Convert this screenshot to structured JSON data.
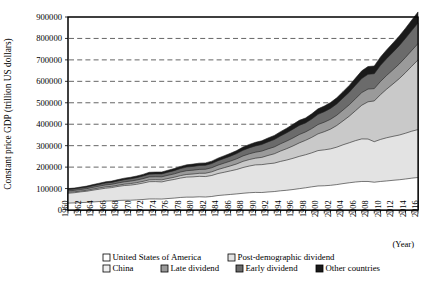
{
  "chart_data": {
    "type": "area",
    "stacked": true,
    "title": "",
    "xlabel": "(Year)",
    "ylabel": "Constant price GDP (trillion US dollars)",
    "ylim": [
      0,
      900000
    ],
    "ytick_step": 100000,
    "yticks": [
      0,
      100000,
      200000,
      300000,
      400000,
      500000,
      600000,
      700000,
      800000,
      900000
    ],
    "grid": true,
    "grid_axis": "y",
    "legend_position": "bottom",
    "x": [
      1960,
      1961,
      1962,
      1963,
      1964,
      1965,
      1966,
      1967,
      1968,
      1969,
      1970,
      1971,
      1972,
      1973,
      1974,
      1975,
      1976,
      1977,
      1978,
      1979,
      1980,
      1981,
      1982,
      1983,
      1984,
      1985,
      1986,
      1987,
      1988,
      1989,
      1990,
      1991,
      1992,
      1993,
      1994,
      1995,
      1996,
      1997,
      1998,
      1999,
      2000,
      2001,
      2002,
      2003,
      2004,
      2005,
      2006,
      2007,
      2008,
      2009,
      2010,
      2011,
      2012,
      2013,
      2014,
      2015,
      2016
    ],
    "xtick_labels": [
      "1960",
      "1962",
      "1964",
      "1966",
      "1968",
      "1970",
      "1972",
      "1974",
      "1976",
      "1978",
      "1980",
      "1982",
      "1984",
      "1986",
      "1988",
      "1990",
      "1992",
      "1994",
      "1996",
      "1998",
      "2000",
      "2002",
      "2004",
      "2006",
      "2008",
      "2010",
      "2012",
      "2014",
      "2016"
    ],
    "xlim": [
      1960,
      2016
    ],
    "series": [
      {
        "name": "United States of America",
        "fill": "#ffffff",
        "values": [
          32000,
          33000,
          34500,
          35500,
          37500,
          39500,
          41500,
          42500,
          44500,
          45500,
          45500,
          47000,
          49000,
          51500,
          51500,
          51000,
          53500,
          55500,
          58500,
          60000,
          60000,
          61500,
          60500,
          63000,
          67500,
          70000,
          72500,
          75000,
          78000,
          80500,
          82000,
          81500,
          84000,
          86000,
          89500,
          92000,
          95500,
          99500,
          103500,
          108000,
          112000,
          113000,
          115000,
          118500,
          123000,
          127000,
          130500,
          133000,
          133000,
          129500,
          133000,
          135500,
          138500,
          141000,
          144500,
          148500,
          151500
        ]
      },
      {
        "name": "Post-demographic dividend",
        "fill": "#e3e3e3",
        "values": [
          46000,
          47500,
          50000,
          52000,
          55000,
          57500,
          60000,
          62000,
          65500,
          68500,
          70500,
          73000,
          76500,
          80500,
          81000,
          80000,
          84000,
          87000,
          90500,
          93500,
          94500,
          95500,
          95500,
          98000,
          102500,
          106000,
          110000,
          114000,
          120000,
          124500,
          128500,
          130000,
          131500,
          132500,
          137000,
          141000,
          145500,
          150500,
          154000,
          158500,
          165000,
          167500,
          170000,
          174500,
          181000,
          186500,
          193000,
          198500,
          198000,
          189000,
          196000,
          201500,
          205000,
          208500,
          213500,
          219000,
          223500
        ]
      },
      {
        "name": "China",
        "fill": "#c9c9c9",
        "values": [
          5000,
          4200,
          4000,
          4500,
          5200,
          5900,
          6300,
          5900,
          5600,
          6400,
          7200,
          7700,
          8000,
          8700,
          8800,
          9600,
          9400,
          10200,
          11400,
          12300,
          13300,
          14000,
          15400,
          16900,
          18800,
          21300,
          23200,
          25900,
          28800,
          30100,
          31200,
          33900,
          38700,
          43500,
          48300,
          53000,
          57700,
          62800,
          67300,
          72200,
          78000,
          84500,
          92000,
          101000,
          111500,
          124000,
          139500,
          157000,
          173500,
          190000,
          209000,
          227000,
          244500,
          263000,
          282500,
          303000,
          325000
        ]
      },
      {
        "name": "Late dividend",
        "fill": "#9a9a9a",
        "values": [
          6500,
          6800,
          7100,
          7500,
          8100,
          8600,
          9200,
          9600,
          10300,
          11000,
          11500,
          12000,
          12700,
          13700,
          13900,
          14200,
          15000,
          15800,
          16700,
          17500,
          17900,
          18300,
          18500,
          19200,
          20400,
          21400,
          22500,
          23800,
          25400,
          26800,
          27900,
          29200,
          30700,
          32000,
          33800,
          35500,
          37300,
          39000,
          39200,
          41000,
          43500,
          44500,
          46000,
          47800,
          50500,
          53000,
          56000,
          59000,
          59500,
          57500,
          61500,
          64000,
          66000,
          68500,
          71000,
          73500,
          76000
        ]
      },
      {
        "name": "Early dividend",
        "fill": "#6b6b6b",
        "values": [
          6000,
          6200,
          6500,
          6900,
          7400,
          7900,
          8400,
          8800,
          9400,
          10100,
          10600,
          11200,
          11900,
          12800,
          13100,
          13500,
          14300,
          15100,
          16000,
          16900,
          17500,
          18100,
          18500,
          19300,
          20500,
          21600,
          22900,
          24300,
          26100,
          27800,
          29200,
          30800,
          32600,
          34300,
          36400,
          38600,
          40900,
          42800,
          42000,
          44500,
          47500,
          48800,
          50700,
          53000,
          56000,
          59000,
          62500,
          66000,
          68500,
          69500,
          75000,
          78500,
          82000,
          85500,
          89000,
          92500,
          96000
        ]
      },
      {
        "name": "Other countries",
        "fill": "#1a1a1a",
        "values": [
          4500,
          4600,
          4800,
          5000,
          5300,
          5600,
          5900,
          6100,
          6500,
          6900,
          7200,
          7500,
          7900,
          8500,
          8600,
          8800,
          9200,
          9600,
          10100,
          10600,
          10800,
          11000,
          11100,
          11500,
          12200,
          12800,
          13500,
          14200,
          15200,
          16000,
          16700,
          17400,
          18300,
          19100,
          20200,
          21300,
          22400,
          23400,
          23000,
          24200,
          25700,
          26300,
          27200,
          28400,
          30000,
          31600,
          33500,
          35400,
          36500,
          36000,
          39000,
          41000,
          43000,
          45000,
          47000,
          49000,
          51500
        ]
      }
    ],
    "legend": [
      {
        "label": "United States of America",
        "fill": "#ffffff"
      },
      {
        "label": "Post-demographic dividend",
        "fill": "#e3e3e3"
      },
      {
        "label": "China",
        "fill": "#efefef"
      },
      {
        "label": "Late dividend",
        "fill": "#9a9a9a"
      },
      {
        "label": "Early dividend",
        "fill": "#6b6b6b"
      },
      {
        "label": "Other countries",
        "fill": "#1a1a1a"
      }
    ]
  }
}
